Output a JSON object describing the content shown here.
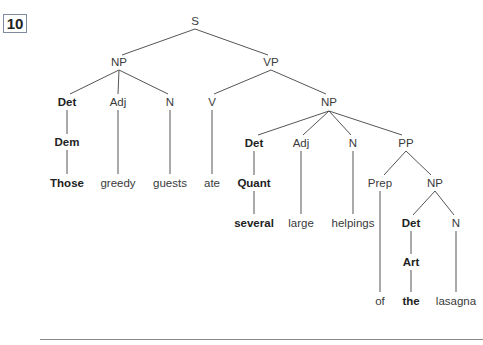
{
  "example_number": "10",
  "tree": {
    "nodes": {
      "S": "S",
      "NP1": "NP",
      "VP": "VP",
      "Det1": "Det",
      "Adj1": "Adj",
      "N1": "N",
      "V": "V",
      "NP2": "NP",
      "Dem": "Dem",
      "Those": "Those",
      "greedy": "greedy",
      "guests": "guests",
      "ate": "ate",
      "Det2": "Det",
      "Adj2": "Adj",
      "N2": "N",
      "PP": "PP",
      "Quant": "Quant",
      "several": "several",
      "large": "large",
      "helpings": "helpings",
      "Prep": "Prep",
      "NP3": "NP",
      "of": "of",
      "Det3": "Det",
      "N3": "N",
      "Art": "Art",
      "the": "the",
      "lasagna": "lasagna"
    },
    "sentence": "Those greedy guests ate several large helpings of the lasagna"
  }
}
